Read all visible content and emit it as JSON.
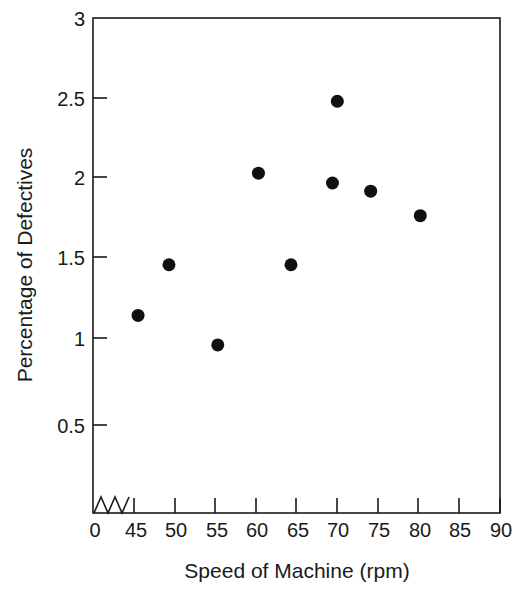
{
  "chart_data": {
    "type": "scatter",
    "title": "",
    "xlabel": "Speed of Machine (rpm)",
    "ylabel": "Percentage of Defectives",
    "xlim": [
      40,
      90
    ],
    "ylim": [
      0,
      3
    ],
    "xticks": [
      "0",
      "45",
      "50",
      "55",
      "60",
      "65",
      "70",
      "75",
      "80",
      "85",
      "90"
    ],
    "xtick_values": [
      0,
      45,
      50,
      55,
      60,
      65,
      70,
      75,
      80,
      85,
      90
    ],
    "yticks": [
      "0.5",
      "1",
      "1.5",
      "2",
      "2.5",
      "3"
    ],
    "ytick_values": [
      0.5,
      1,
      1.5,
      2,
      2.5,
      3
    ],
    "grid": false,
    "legend": false,
    "axis_break": {
      "axis": "x",
      "between": [
        0,
        45
      ],
      "style": "zigzag"
    },
    "marker": {
      "shape": "circle",
      "color": "#111111",
      "radius": 6.5
    },
    "points": [
      {
        "x": 45.5,
        "y": 1.17
      },
      {
        "x": 49.3,
        "y": 1.48
      },
      {
        "x": 55.3,
        "y": 0.99
      },
      {
        "x": 60.3,
        "y": 2.04
      },
      {
        "x": 64.3,
        "y": 1.48
      },
      {
        "x": 69.4,
        "y": 1.98
      },
      {
        "x": 70.0,
        "y": 2.48
      },
      {
        "x": 74.1,
        "y": 1.93
      },
      {
        "x": 80.2,
        "y": 1.78
      }
    ]
  }
}
